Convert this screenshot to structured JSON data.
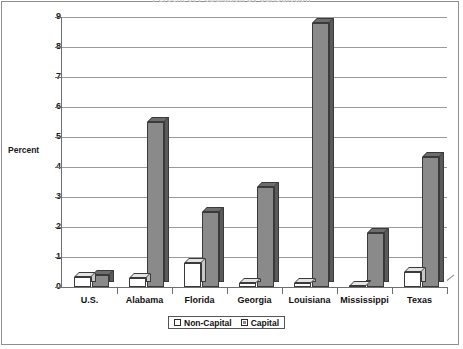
{
  "chart_data": {
    "type": "bar",
    "title": "Percent of Population by Jurisdiction",
    "xlabel": "",
    "ylabel": "Percent",
    "ylim": [
      0,
      9
    ],
    "yticks": [
      "0",
      "1",
      "2",
      "3",
      "4",
      "5",
      "6",
      "7",
      "8",
      "9"
    ],
    "grid": true,
    "legend_position": "bottom",
    "categories": [
      "U.S.",
      "Alabama",
      "Florida",
      "Georgia",
      "Louisiana",
      "Mississippi",
      "Texas"
    ],
    "series": [
      {
        "name": "Non-Capital",
        "color": "#ffffff",
        "values": [
          0.35,
          0.3,
          0.8,
          0.15,
          0.15,
          0.05,
          0.5
        ]
      },
      {
        "name": "Capital",
        "color": "#8a8a8a",
        "values": [
          0.4,
          5.5,
          2.5,
          3.35,
          8.8,
          1.8,
          4.35
        ]
      }
    ]
  }
}
